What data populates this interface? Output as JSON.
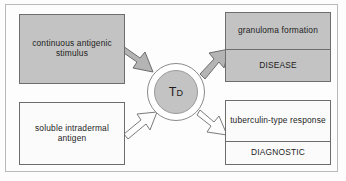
{
  "figure": {
    "type": "flow-diagram",
    "hub": {
      "label_main": "T",
      "label_sub": "D",
      "label_full": "TD",
      "fill_color": "#c3c3c3",
      "ring_color": "#8a8a8a"
    },
    "palette": {
      "gray_fill": "#c3c3c3",
      "white_fill": "#fbfbfb",
      "stroke": "#6d6d6d",
      "text": "#1d1d1d",
      "frame": "#b9b9b9"
    },
    "inputs": [
      {
        "id": "continuous-antigenic-stimulus",
        "lines": "continuous antigenic stimulus",
        "fill": "gray",
        "arrow": "filled"
      },
      {
        "id": "soluble-intradermal-antigen",
        "lines": "soluble intradermal antigen",
        "fill": "white",
        "arrow": "outline"
      }
    ],
    "outputs": [
      {
        "id": "granuloma-disease",
        "top_lines": "granuloma formation",
        "bottom_label": "DISEASE",
        "fill": "gray",
        "arrow": "filled"
      },
      {
        "id": "tuberculin-diagnostic",
        "top_lines": "tuberculin-type response",
        "bottom_label": "DIAGNOSTIC",
        "fill": "white",
        "arrow": "outline"
      }
    ]
  }
}
